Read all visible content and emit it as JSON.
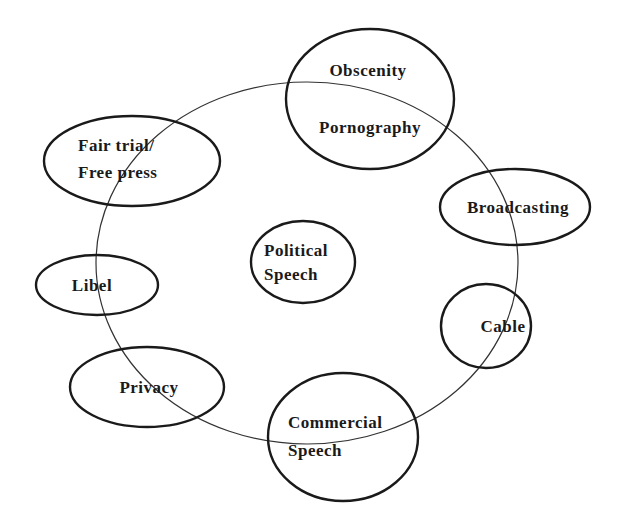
{
  "diagram": {
    "type": "concept-map",
    "center": {
      "label_lines": [
        "Political",
        "Speech"
      ]
    },
    "nodes": [
      {
        "id": "obscenity",
        "label_lines": [
          "Obscenity",
          "Pornography"
        ]
      },
      {
        "id": "fair-trial",
        "label_lines": [
          "Fair trial/",
          "Free press"
        ]
      },
      {
        "id": "broadcasting",
        "label_lines": [
          "Broadcasting"
        ]
      },
      {
        "id": "libel",
        "label_lines": [
          "Libel"
        ]
      },
      {
        "id": "cable",
        "label_lines": [
          "Cable"
        ]
      },
      {
        "id": "privacy",
        "label_lines": [
          "Privacy"
        ]
      },
      {
        "id": "commercial-speech",
        "label_lines": [
          "Commercial",
          "Speech"
        ]
      }
    ],
    "colors": {
      "background": "#ffffff",
      "stroke": "#1a1a1a",
      "text": "#1a1a1a"
    }
  }
}
